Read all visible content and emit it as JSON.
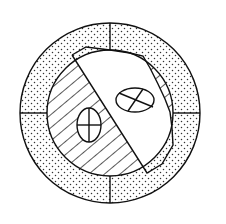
{
  "diagram": {
    "canvas": {
      "width": 226,
      "height": 224,
      "background": "#ffffff"
    },
    "outer_ring": {
      "cx": 110,
      "cy": 113,
      "r_outer": 90,
      "r_inner": 63,
      "fill_pattern": "stipple-dots",
      "dividers": [
        "top",
        "bottom",
        "left",
        "right"
      ]
    },
    "inner_region": {
      "hatched_part": {
        "pattern": "diagonal-lines",
        "side": "left-lower"
      },
      "white_part": {
        "shape": "irregular-polygon",
        "side": "upper-right"
      }
    },
    "ellipses": [
      {
        "id": "left-ellipse",
        "cx": 89,
        "cy": 125,
        "rx": 12,
        "ry": 17,
        "cross": "orthogonal"
      },
      {
        "id": "right-ellipse",
        "cx": 135,
        "cy": 100,
        "rx": 19,
        "ry": 12,
        "cross": "diagonal"
      }
    ],
    "colors": {
      "line": "#111111",
      "background": "#ffffff",
      "dots": "#333333"
    }
  }
}
